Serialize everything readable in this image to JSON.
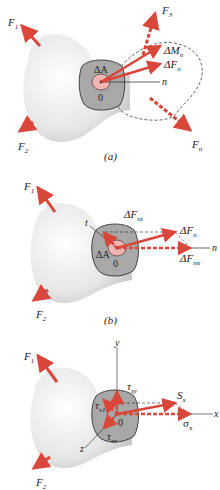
{
  "colors": {
    "force_arrow": "#d9463a",
    "body_fill": "#e9e9e9",
    "section_fill": "#a8a8a8",
    "area_fill": "#f2b4b0",
    "line": "#222222"
  },
  "panels": [
    {
      "id": "a",
      "caption": "(a)",
      "labels": {
        "F1": "F",
        "F1_sub": "1",
        "F2": "F",
        "F2_sub": "2",
        "F3": "F",
        "F3_sub": "3",
        "Fn": "F",
        "Fn_sub": "n",
        "dMn": "ΔM",
        "dMn_sub": "n",
        "dFn": "ΔF",
        "dFn_sub": "n",
        "dA": "ΔA",
        "origin": "0",
        "n_axis": "n"
      }
    },
    {
      "id": "b",
      "caption": "(b)",
      "labels": {
        "F1": "F",
        "F1_sub": "1",
        "F2": "F",
        "F2_sub": "2",
        "dFnt": "ΔF",
        "dFnt_sub": "nt",
        "dFn": "ΔF",
        "dFn_sub": "n",
        "dFnn": "ΔF",
        "dFnn_sub": "nn",
        "dA": "ΔA",
        "origin": "0",
        "t_axis": "t",
        "n_axis": "n"
      }
    },
    {
      "id": "c",
      "caption": "",
      "labels": {
        "F1": "F",
        "F1_sub": "1",
        "F2": "F",
        "F2_sub": "2",
        "y_axis": "y",
        "x_axis": "x",
        "z_axis": "z",
        "txy": "τ",
        "txy_sub": "xy",
        "txz": "τ",
        "txz_sub": "xz",
        "tx1": "τ",
        "tx1_sub": "x1",
        "Sx": "S",
        "Sx_sub": "x",
        "sx": "σ",
        "sx_sub": "x",
        "origin": "0"
      }
    }
  ]
}
